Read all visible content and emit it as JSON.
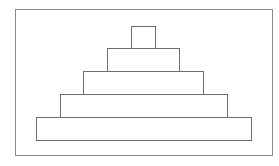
{
  "diagram": {
    "type": "stepped-pyramid",
    "frame": {
      "x": 15,
      "y": 9,
      "w": 258,
      "h": 147,
      "color": "#8a8a8a"
    },
    "line_color": "#6e6e6e",
    "levels": [
      {
        "level": 1,
        "x": 131,
        "y": 26,
        "w": 25,
        "h": 23
      },
      {
        "level": 2,
        "x": 107,
        "y": 48,
        "w": 73,
        "h": 24
      },
      {
        "level": 3,
        "x": 83,
        "y": 71,
        "w": 121,
        "h": 24
      },
      {
        "level": 4,
        "x": 60,
        "y": 94,
        "w": 168,
        "h": 24
      },
      {
        "level": 5,
        "x": 36,
        "y": 117,
        "w": 216,
        "h": 24
      }
    ]
  }
}
